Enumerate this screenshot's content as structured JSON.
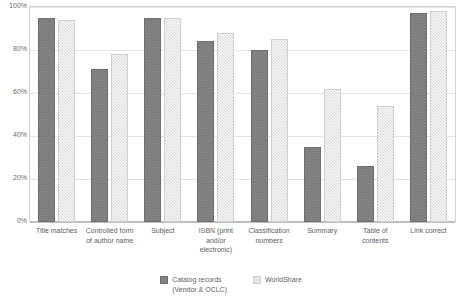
{
  "chart_data": {
    "type": "bar",
    "title": "",
    "xlabel": "",
    "ylabel": "",
    "ylim": [
      0,
      100
    ],
    "yticks": [
      "0%",
      "20%",
      "40%",
      "60%",
      "80%",
      "100%"
    ],
    "ytick_values": [
      0,
      20,
      40,
      60,
      80,
      100
    ],
    "grid": true,
    "legend_position": "bottom",
    "categories": [
      "Title matches",
      "Controlled form of author name",
      "Subject",
      "ISBN (print and/or electronic)",
      "Classification numbers",
      "Summary",
      "Table of contents",
      "Link correct"
    ],
    "series": [
      {
        "name": "Catalog records (Vendor & OCLC)",
        "color": "#787878",
        "values": [
          95,
          71,
          95,
          84,
          80,
          35,
          26,
          97
        ]
      },
      {
        "name": "WorldShare",
        "color": "#dddddd",
        "values": [
          94,
          78,
          95,
          88,
          85,
          62,
          54,
          98
        ]
      }
    ]
  }
}
